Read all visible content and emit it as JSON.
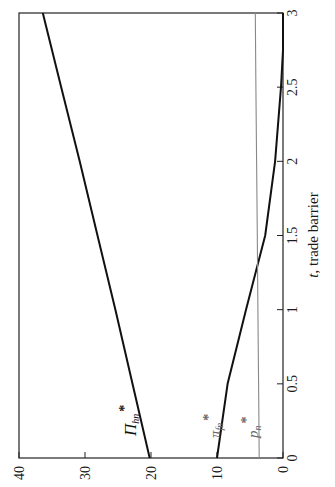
{
  "chart_data": {
    "type": "line",
    "orientation": "rotated-90-counterclockwise",
    "title": "",
    "xlabel": "t, trade barrier",
    "xlabel_italic_part": "t",
    "xlabel_rest": ", trade barrier",
    "ylabel": "",
    "xlim": [
      0,
      3
    ],
    "ylim": [
      0,
      40
    ],
    "x_ticks": [
      "0",
      "0.5",
      "1",
      "1.5",
      "2",
      "2.5",
      "3"
    ],
    "y_ticks": [
      "0",
      "10",
      "20",
      "30",
      "40"
    ],
    "grid": false,
    "legend": "inline labels",
    "x": [
      0,
      0.5,
      1,
      1.5,
      2,
      2.5,
      3
    ],
    "series": [
      {
        "name": "Π_hn*",
        "label_main": "Π",
        "label_sub": "hn",
        "label_sup": "*",
        "color": "#111111",
        "values": [
          20.2,
          22.8,
          25.4,
          28.1,
          30.8,
          33.6,
          36.4
        ]
      },
      {
        "name": "π_fn*",
        "label_main": "π",
        "label_sub": "fn",
        "label_sup": "*",
        "color": "#111111",
        "label_color": "#666666",
        "values": [
          10.0,
          8.4,
          5.6,
          2.7,
          1.2,
          0.3,
          0.0
        ]
      },
      {
        "name": "p_n*",
        "label_main": "p",
        "label_sub": "n",
        "label_sup": "*",
        "color": "#888888",
        "label_color": "#666666",
        "values": [
          3.6,
          3.7,
          3.8,
          3.9,
          4.0,
          4.1,
          4.2
        ]
      }
    ]
  }
}
